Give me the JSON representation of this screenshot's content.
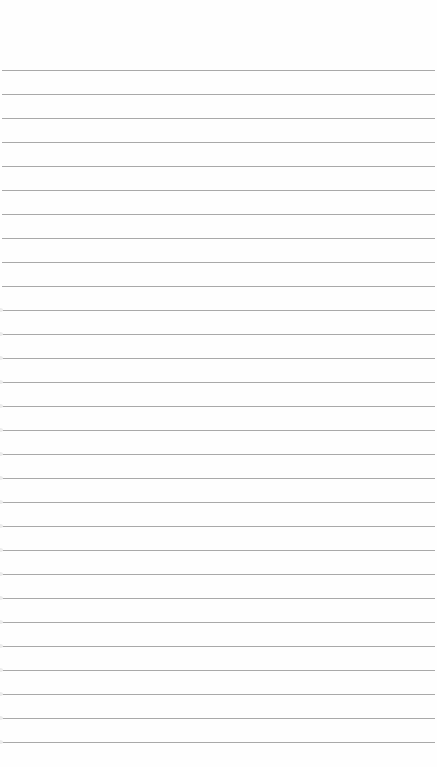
{
  "page": {
    "type": "lined-notebook-paper",
    "line_color": "#9a9a9a",
    "background_color": "#fefefe",
    "first_line_y": 70,
    "line_spacing": 24,
    "line_count": 29
  }
}
